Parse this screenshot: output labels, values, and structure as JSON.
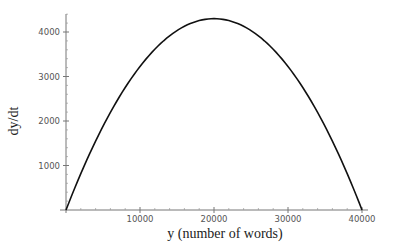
{
  "chart_data": {
    "type": "line",
    "title": "",
    "xlabel": "y (number of words)",
    "ylabel": "dy/dt",
    "xlim": [
      0,
      40000
    ],
    "ylim": [
      0,
      4300
    ],
    "x_ticks": [
      10000,
      20000,
      30000,
      40000
    ],
    "x_tick_labels": [
      "10000",
      "20000",
      "30000",
      "40000"
    ],
    "y_ticks": [
      1000,
      2000,
      3000,
      4000
    ],
    "y_tick_labels": [
      "1000",
      "2000",
      "3000",
      "4000"
    ],
    "grid": false,
    "legend": null,
    "series": [
      {
        "name": "dy/dt",
        "description": "Logistic growth rate, parabola with zeros at y=0 and y=40000, peak ~4300 at y=20000",
        "x": [
          0,
          5000,
          10000,
          15000,
          20000,
          25000,
          30000,
          35000,
          40000
        ],
        "values": [
          0,
          1880,
          3225,
          4030,
          4300,
          4030,
          3225,
          1880,
          0
        ]
      }
    ]
  }
}
